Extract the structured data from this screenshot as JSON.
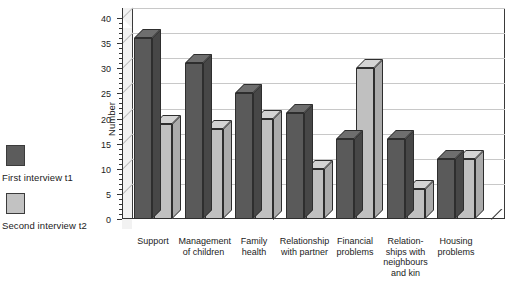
{
  "chart_data": {
    "type": "bar",
    "title": "",
    "xlabel": "",
    "ylabel": "Number",
    "ylim": [
      0,
      40
    ],
    "ytick_step": 5,
    "yticks": [
      "0",
      "5",
      "10",
      "15",
      "20",
      "25",
      "30",
      "35",
      "40"
    ],
    "grid": true,
    "legend_position": "left",
    "categories": [
      "Support",
      "Management of children",
      "Family health",
      "Relationship with partner",
      "Financial problems",
      "Relationships with neighbours and kin",
      "Housing problems"
    ],
    "category_label_lines": [
      [
        "Support"
      ],
      [
        "Management",
        "of children"
      ],
      [
        "Family",
        "health"
      ],
      [
        "Relationship",
        "with partner"
      ],
      [
        "Financial",
        "problems"
      ],
      [
        "Relation-",
        "ships with",
        "neighbours",
        "and kin"
      ],
      [
        "Housing",
        "problems"
      ]
    ],
    "series": [
      {
        "name": "First interview t1",
        "color": "#5a5a5a",
        "values": [
          36,
          31,
          25,
          21,
          16,
          16,
          12
        ]
      },
      {
        "name": "Second interview t2",
        "color": "#c0c0c0",
        "values": [
          19,
          18,
          20,
          10,
          30,
          6,
          12
        ]
      }
    ]
  },
  "legend": {
    "entries": [
      {
        "label": "First interview t1",
        "swatch": "dark"
      },
      {
        "label": "Second interview t2",
        "swatch": "light"
      }
    ]
  }
}
